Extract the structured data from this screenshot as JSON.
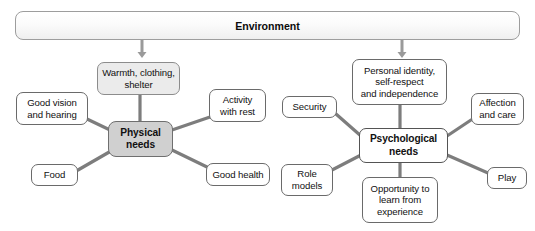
{
  "diagram": {
    "title_banner": {
      "label": "Environment"
    },
    "arrows": [
      {
        "name": "arrow-to-physical-cluster",
        "x": 142,
        "y1": 40,
        "y2": 58
      },
      {
        "name": "arrow-to-psychological-cluster",
        "x": 402,
        "y1": 40,
        "y2": 58
      }
    ],
    "clusters": [
      {
        "id": "physical",
        "center": {
          "label": "Physical needs",
          "lines": [
            "Physical",
            "needs"
          ],
          "fill": "#d0d0d0",
          "x": 108,
          "y": 121,
          "w": 65,
          "h": 36
        },
        "satellites": [
          {
            "id": "warmth",
            "label": "Warmth, clothing, shelter",
            "lines": [
              "Warmth, clothing,",
              "shelter"
            ],
            "fill": "#ebebeb",
            "x": 97,
            "y": 62,
            "w": 83,
            "h": 33
          },
          {
            "id": "good-vision-and-hearing",
            "label": "Good vision and hearing",
            "lines": [
              "Good vision",
              "and hearing"
            ],
            "fill": "#ffffff",
            "x": 16,
            "y": 92,
            "w": 72,
            "h": 33
          },
          {
            "id": "activity-with-rest",
            "label": "Activity with rest",
            "lines": [
              "Activity",
              "with rest"
            ],
            "fill": "#ffffff",
            "x": 209,
            "y": 89,
            "w": 57,
            "h": 33
          },
          {
            "id": "food",
            "label": "Food",
            "lines": [
              "Food"
            ],
            "fill": "#ffffff",
            "x": 31,
            "y": 164,
            "w": 47,
            "h": 22
          },
          {
            "id": "good-health",
            "label": "Good health",
            "lines": [
              "Good health"
            ],
            "fill": "#ffffff",
            "x": 206,
            "y": 163,
            "w": 64,
            "h": 23
          }
        ]
      },
      {
        "id": "psychological",
        "center": {
          "label": "Psychological needs",
          "lines": [
            "Psychological",
            "needs"
          ],
          "fill": "#ffffff",
          "x": 359,
          "y": 128,
          "w": 89,
          "h": 35
        },
        "satellites": [
          {
            "id": "personal-identity",
            "label": "Personal identity, self-respect and independence",
            "lines": [
              "Personal identity,",
              "self-respect",
              "and independence"
            ],
            "fill": "#ffffff",
            "x": 352,
            "y": 59,
            "w": 95,
            "h": 46
          },
          {
            "id": "security",
            "label": "Security",
            "lines": [
              "Security"
            ],
            "fill": "#ffffff",
            "x": 282,
            "y": 96,
            "w": 55,
            "h": 22
          },
          {
            "id": "affection-and-care",
            "label": "Affection and care",
            "lines": [
              "Affection",
              "and care"
            ],
            "fill": "#ffffff",
            "x": 471,
            "y": 93,
            "w": 53,
            "h": 32
          },
          {
            "id": "role-models",
            "label": "Role models",
            "lines": [
              "Role",
              "models"
            ],
            "fill": "#ffffff",
            "x": 281,
            "y": 164,
            "w": 52,
            "h": 32
          },
          {
            "id": "opportunity-to-learn",
            "label": "Opportunity to learn from experience",
            "lines": [
              "Opportunity to",
              "learn from",
              "experience"
            ],
            "fill": "#ffffff",
            "x": 362,
            "y": 177,
            "w": 76,
            "h": 46
          },
          {
            "id": "play",
            "label": "Play",
            "lines": [
              "Play"
            ],
            "fill": "#ffffff",
            "x": 487,
            "y": 167,
            "w": 40,
            "h": 22
          }
        ]
      }
    ],
    "connectors": [
      {
        "name": "connector-physical-warmth",
        "x1": 140,
        "y1": 121,
        "x2": 140,
        "y2": 95
      },
      {
        "name": "connector-physical-good-vision",
        "x1": 110,
        "y1": 130,
        "x2": 87,
        "y2": 119
      },
      {
        "name": "connector-physical-activity",
        "x1": 172,
        "y1": 130,
        "x2": 210,
        "y2": 117
      },
      {
        "name": "connector-physical-food",
        "x1": 111,
        "y1": 151,
        "x2": 78,
        "y2": 170
      },
      {
        "name": "connector-physical-good-health",
        "x1": 172,
        "y1": 150,
        "x2": 207,
        "y2": 167
      },
      {
        "name": "connector-psych-personal-identity",
        "x1": 400,
        "y1": 128,
        "x2": 400,
        "y2": 105
      },
      {
        "name": "connector-psych-security",
        "x1": 361,
        "y1": 136,
        "x2": 336,
        "y2": 114
      },
      {
        "name": "connector-psych-affection",
        "x1": 447,
        "y1": 136,
        "x2": 471,
        "y2": 120
      },
      {
        "name": "connector-psych-role-models",
        "x1": 361,
        "y1": 155,
        "x2": 332,
        "y2": 170
      },
      {
        "name": "connector-psych-opportunity",
        "x1": 400,
        "y1": 163,
        "x2": 400,
        "y2": 177
      },
      {
        "name": "connector-psych-play",
        "x1": 447,
        "y1": 155,
        "x2": 488,
        "y2": 173
      }
    ],
    "colors": {
      "line": "#7d7d7d",
      "arrow": "#9a9a9a",
      "box_border": "#6d6d6d",
      "center_physical_fill": "#d0d0d0",
      "shaded_fill": "#ebebeb",
      "text": "#111111"
    }
  }
}
